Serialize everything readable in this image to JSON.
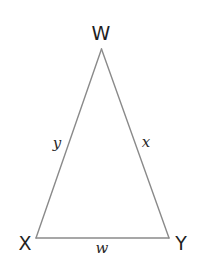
{
  "diagram": {
    "type": "triangle",
    "vertices": {
      "W": {
        "label": "W",
        "x": 101.5,
        "y": 49
      },
      "X": {
        "label": "X",
        "x": 36,
        "y": 238
      },
      "Y": {
        "label": "Y",
        "x": 169,
        "y": 238
      }
    },
    "sides": {
      "WX": {
        "label": "y"
      },
      "WY": {
        "label": "x"
      },
      "XY": {
        "label": "w"
      }
    },
    "colors": {
      "edge": "#8a8a8a",
      "text": "#1f1f1f",
      "background": "#ffffff"
    }
  }
}
